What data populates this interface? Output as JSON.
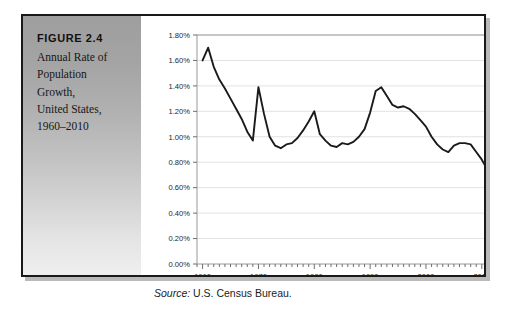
{
  "figure": {
    "label": "FIGURE 2.4",
    "caption_lines": [
      "Annual Rate of",
      "Population",
      "Growth,",
      "United States,",
      "1960–2010"
    ]
  },
  "source": {
    "label": "Source:",
    "text": " U.S. Census Bureau."
  },
  "colors": {
    "line": "#1a1a1a",
    "grid": "#e2e2e2",
    "plot_border": "#9a9a9a",
    "frame": "#191919",
    "panel_top": "#9e9e9e",
    "panel_bottom": "#efefef",
    "background": "#ffffff"
  },
  "chart_data": {
    "type": "line",
    "xlabel": "",
    "ylabel": "",
    "xlim": [
      1959,
      2012
    ],
    "ylim": [
      0.0,
      1.8
    ],
    "ytick_labels": [
      "0.00%",
      "0.20%",
      "0.40%",
      "0.60%",
      "0.80%",
      "1.00%",
      "1.20%",
      "1.40%",
      "1.60%",
      "1.80%"
    ],
    "ytick_values": [
      0.0,
      0.2,
      0.4,
      0.6,
      0.8,
      1.0,
      1.2,
      1.4,
      1.6,
      1.8
    ],
    "xtick_labels": [
      "1960",
      "1970",
      "1980",
      "1990",
      "2000",
      "2010"
    ],
    "xtick_values": [
      1960,
      1970,
      1980,
      1990,
      2000,
      2010
    ],
    "grid": true,
    "legend": false,
    "series": [
      {
        "name": "Annual rate of population growth",
        "x": [
          1960,
          1961,
          1962,
          1963,
          1964,
          1965,
          1966,
          1967,
          1968,
          1969,
          1970,
          1971,
          1972,
          1973,
          1974,
          1975,
          1976,
          1977,
          1978,
          1979,
          1980,
          1981,
          1982,
          1983,
          1984,
          1985,
          1986,
          1987,
          1988,
          1989,
          1990,
          1991,
          1992,
          1993,
          1994,
          1995,
          1996,
          1997,
          1998,
          1999,
          2000,
          2001,
          2002,
          2003,
          2004,
          2005,
          2006,
          2007,
          2008,
          2009,
          2010,
          2011,
          2012
        ],
        "values": [
          1.6,
          1.7,
          1.55,
          1.45,
          1.38,
          1.3,
          1.22,
          1.14,
          1.04,
          0.97,
          1.39,
          1.18,
          1.0,
          0.93,
          0.91,
          0.94,
          0.95,
          0.99,
          1.05,
          1.12,
          1.2,
          1.02,
          0.97,
          0.93,
          0.92,
          0.95,
          0.94,
          0.96,
          1.0,
          1.06,
          1.19,
          1.36,
          1.39,
          1.32,
          1.25,
          1.23,
          1.24,
          1.22,
          1.18,
          1.13,
          1.08,
          1.0,
          0.94,
          0.9,
          0.88,
          0.93,
          0.95,
          0.95,
          0.94,
          0.88,
          0.82,
          0.74,
          0.75
        ]
      }
    ]
  }
}
